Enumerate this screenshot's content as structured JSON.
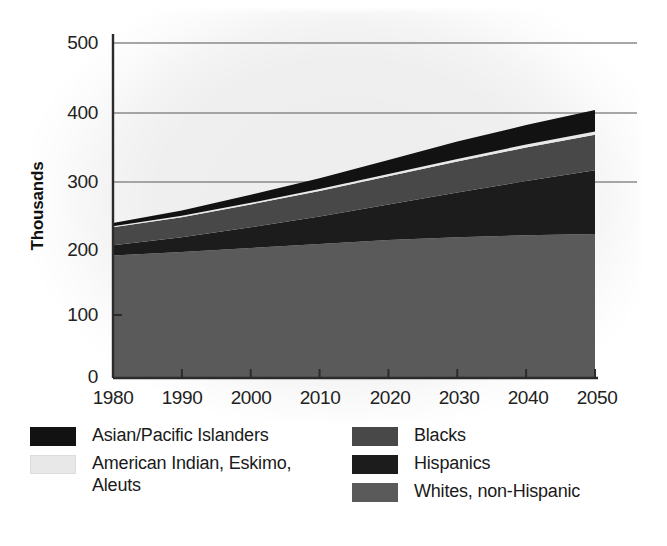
{
  "chart_data": {
    "type": "area",
    "title": "",
    "subtitle": "",
    "xlabel": "",
    "ylabel": "Thousands",
    "stacked": true,
    "grid": true,
    "grid_lines": [
      300,
      400,
      500
    ],
    "legend_position": "bottom",
    "x": [
      1980,
      1990,
      2000,
      2010,
      2020,
      2030,
      2040,
      2050
    ],
    "xticklabels": [
      "1980",
      "1990",
      "2000",
      "2010",
      "2020",
      "2030",
      "2040",
      "2050"
    ],
    "xlim": [
      1980,
      2050
    ],
    "yticklabels": [
      "0",
      "100",
      "200",
      "300",
      "400",
      "500"
    ],
    "yticks": [
      0,
      100,
      200,
      300,
      400,
      500
    ],
    "ylim": [
      0,
      500
    ],
    "series": [
      {
        "name": "Whites, non-Hispanic",
        "color": "#5a5a5a",
        "values": [
          183,
          188,
          194,
          200,
          206,
          210,
          213,
          215
        ]
      },
      {
        "name": "Hispanics",
        "color": "#1c1c1c",
        "values": [
          15,
          22,
          31,
          41,
          53,
          67,
          81,
          95
        ]
      },
      {
        "name": "Blacks",
        "color": "#484848",
        "values": [
          27,
          30,
          34,
          38,
          42,
          46,
          50,
          53
        ]
      },
      {
        "name": "American Indian, Eskimo, Aleuts",
        "color": "#e8e8e8",
        "values": [
          1.5,
          2,
          2.5,
          3,
          3.5,
          4,
          4.5,
          5
        ]
      },
      {
        "name": "Asian/Pacific Islanders",
        "color": "#121212",
        "values": [
          5,
          8,
          12,
          16,
          21,
          26,
          29,
          32
        ]
      }
    ],
    "totals": [
      232,
      250,
      273,
      298,
      326,
      353,
      378,
      400
    ]
  },
  "axes": {
    "ylabel": "Thousands",
    "yticks": [
      {
        "label": "500"
      },
      {
        "label": "400"
      },
      {
        "label": "300"
      },
      {
        "label": "200"
      },
      {
        "label": "100"
      },
      {
        "label": "0"
      }
    ],
    "xticks": [
      {
        "label": "1980"
      },
      {
        "label": "1990"
      },
      {
        "label": "2000"
      },
      {
        "label": "2010"
      },
      {
        "label": "2020"
      },
      {
        "label": "2030"
      },
      {
        "label": "2040"
      },
      {
        "label": "2050"
      }
    ]
  },
  "legend": {
    "left_column": [
      {
        "label": "Asian/Pacific Islanders",
        "color": "#121212"
      },
      {
        "label": "American Indian, Eskimo,\nAleuts",
        "color": "#e8e8e8"
      }
    ],
    "right_column": [
      {
        "label": "Blacks",
        "color": "#484848"
      },
      {
        "label": "Hispanics",
        "color": "#1c1c1c"
      },
      {
        "label": "Whites, non-Hispanic",
        "color": "#5a5a5a"
      }
    ]
  },
  "colors": {
    "background": "#ffffff",
    "plot_glow": "#efefef",
    "axis": "#2b2b2b",
    "gridline": "#8a8a8a"
  }
}
